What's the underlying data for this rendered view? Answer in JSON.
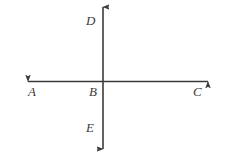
{
  "figure": {
    "background_color": "#ffffff",
    "stroke_color": "#3b3b3b",
    "label_color": "#3b3b3b",
    "stroke_width": 1.6,
    "canvas": {
      "width": 225,
      "height": 162
    },
    "intersection": {
      "label": "B",
      "x": 103,
      "y": 81
    },
    "lines": [
      {
        "name": "vertical-line",
        "orientation": "vertical",
        "from": {
          "x": 103,
          "y": 4
        },
        "to": {
          "x": 103,
          "y": 152
        },
        "arrowheads": [
          "start",
          "end"
        ],
        "endpoint_labels": {
          "top": "D",
          "bottom": "E"
        }
      },
      {
        "name": "horizontal-line",
        "orientation": "horizontal",
        "from": {
          "x": 24,
          "y": 81
        },
        "to": {
          "x": 212,
          "y": 81
        },
        "arrowheads": [
          "start",
          "end"
        ],
        "endpoint_labels": {
          "left": "A",
          "right": "C"
        }
      }
    ],
    "labels": [
      {
        "id": "D",
        "text": "D",
        "x": 86,
        "y": 14,
        "anchor": "upper-left-of-vertical"
      },
      {
        "id": "A",
        "text": "A",
        "x": 28,
        "y": 85,
        "anchor": "below-left-end"
      },
      {
        "id": "B",
        "text": "B",
        "x": 89,
        "y": 85,
        "anchor": "below-left-of-intersection"
      },
      {
        "id": "C",
        "text": "C",
        "x": 193,
        "y": 85,
        "anchor": "below-right-end"
      },
      {
        "id": "E",
        "text": "E",
        "x": 86,
        "y": 121,
        "anchor": "lower-left-of-vertical"
      }
    ]
  }
}
